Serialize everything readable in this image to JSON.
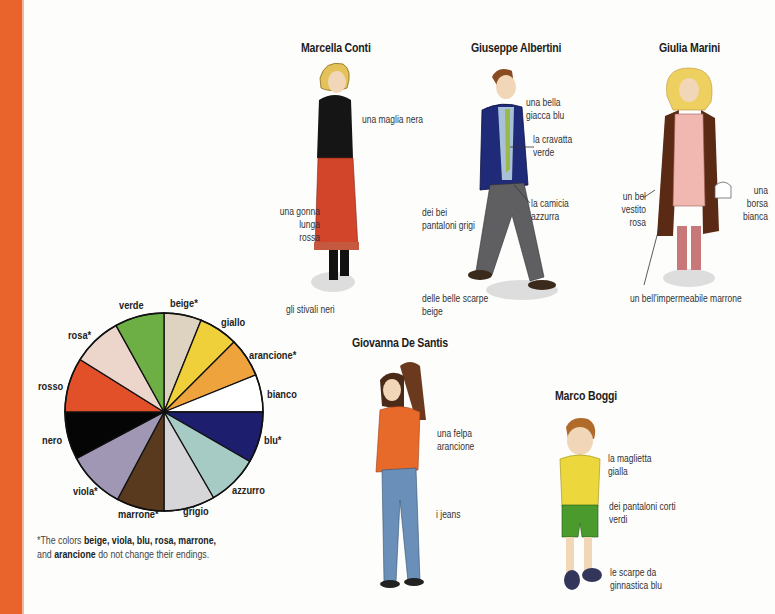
{
  "colors": {
    "side_bar": "#e8642c"
  },
  "people": {
    "marcella": {
      "name": "Marcella Conti",
      "labels": {
        "sweater": "una maglia nera",
        "skirt": [
          "una gonna",
          "lunga",
          "rossa"
        ],
        "boots": "gli stivali neri"
      }
    },
    "giuseppe": {
      "name": "Giuseppe Albertini",
      "labels": {
        "jacket": [
          "una bella",
          "giacca blu"
        ],
        "tie": [
          "la cravatta",
          "verde"
        ],
        "shirt": [
          "la camicia",
          "azzurra"
        ],
        "pants": [
          "dei bei",
          "pantaloni grigi"
        ],
        "shoes": [
          "delle belle scarpe",
          "beige"
        ]
      }
    },
    "giulia": {
      "name": "Giulia Marini",
      "labels": {
        "dress": [
          "un bel",
          "vestito",
          "rosa"
        ],
        "bag": [
          "una",
          "borsa",
          "bianca"
        ],
        "raincoat": "un bell'impermeabile marrone"
      }
    },
    "giovanna": {
      "name": "Giovanna De Santis",
      "labels": {
        "sweatshirt": [
          "una felpa",
          "arancione"
        ],
        "jeans": "i jeans"
      }
    },
    "marco": {
      "name": "Marco Boggi",
      "labels": {
        "tshirt": [
          "la maglietta",
          "gialla"
        ],
        "shorts": [
          "dei pantaloni corti",
          "verdi"
        ],
        "sneakers": [
          "le scarpe da",
          "ginnastica blu"
        ]
      }
    }
  },
  "color_wheel": {
    "slices": [
      {
        "label": "beige*",
        "color": "#ddd3c0",
        "start": 0,
        "end": 22
      },
      {
        "label": "giallo",
        "color": "#f0d03a",
        "start": 22,
        "end": 45
      },
      {
        "label": "arancione*",
        "color": "#eea33c",
        "start": 45,
        "end": 68
      },
      {
        "label": "bianco",
        "color": "#ffffff",
        "start": 68,
        "end": 90
      },
      {
        "label": "blu*",
        "color": "#1d1f6e",
        "start": 90,
        "end": 120
      },
      {
        "label": "azzurro",
        "color": "#a6cbc4",
        "start": 120,
        "end": 150
      },
      {
        "label": "grigio",
        "color": "#d6d6d8",
        "start": 150,
        "end": 180
      },
      {
        "label": "marrone*",
        "color": "#5a3a1e",
        "start": 180,
        "end": 208
      },
      {
        "label": "viola*",
        "color": "#9f97b4",
        "start": 208,
        "end": 242
      },
      {
        "label": "nero",
        "color": "#050505",
        "start": 242,
        "end": 270
      },
      {
        "label": "rosso",
        "color": "#e2502a",
        "start": 270,
        "end": 302
      },
      {
        "label": "rosa*",
        "color": "#ecd5cb",
        "start": 302,
        "end": 331
      },
      {
        "label": "verde",
        "color": "#6daf45",
        "start": 331,
        "end": 360
      }
    ],
    "footnote": {
      "prefix": "*The colors ",
      "bold1": "beige, viola, blu, rosa, marrone,",
      "mid": "and ",
      "bold2": "arancione",
      "suffix": " do not change their endings."
    }
  }
}
